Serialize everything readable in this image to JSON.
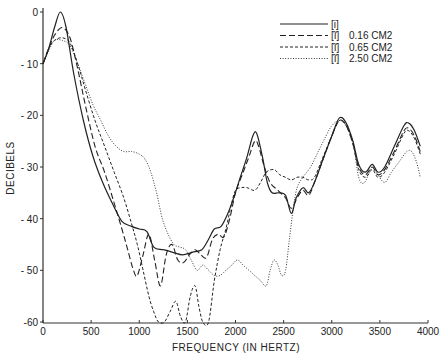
{
  "chart_data": {
    "type": "line",
    "title": "",
    "xlabel": "FREQUENCY (IN HERTZ)",
    "ylabel": "DECIBELS",
    "xlim": [
      0,
      4000
    ],
    "ylim": [
      -60,
      0
    ],
    "x_ticks": [
      0,
      500,
      1000,
      1500,
      2000,
      2500,
      3000,
      3500,
      4000
    ],
    "x_tick_labels": [
      "0",
      "500",
      "1000",
      "1500",
      "2000",
      "2500",
      "3000",
      "3500",
      "4000"
    ],
    "y_ticks": [
      0,
      -10,
      -20,
      -30,
      -40,
      -50,
      -60
    ],
    "y_tick_labels": [
      "0",
      "- 10",
      "- 20",
      "- 30",
      "- 40",
      "- 50",
      "-60"
    ],
    "grid": false,
    "legend_position": "upper right",
    "series": [
      {
        "name": "[i]",
        "label": "",
        "style": "solid",
        "points": [
          [
            0,
            -10
          ],
          [
            60,
            -7
          ],
          [
            120,
            -3
          ],
          [
            180,
            0
          ],
          [
            240,
            -3
          ],
          [
            320,
            -12
          ],
          [
            420,
            -21
          ],
          [
            520,
            -28
          ],
          [
            620,
            -33
          ],
          [
            720,
            -37
          ],
          [
            820,
            -40.5
          ],
          [
            920,
            -41.5
          ],
          [
            1000,
            -42
          ],
          [
            1080,
            -42.5
          ],
          [
            1150,
            -45.5
          ],
          [
            1250,
            -46
          ],
          [
            1350,
            -46.5
          ],
          [
            1450,
            -47
          ],
          [
            1550,
            -46.5
          ],
          [
            1650,
            -46
          ],
          [
            1720,
            -44
          ],
          [
            1780,
            -42
          ],
          [
            1850,
            -41.5
          ],
          [
            1920,
            -39
          ],
          [
            1980,
            -36
          ],
          [
            2050,
            -32
          ],
          [
            2120,
            -28
          ],
          [
            2180,
            -24
          ],
          [
            2220,
            -23.5
          ],
          [
            2280,
            -28
          ],
          [
            2330,
            -33
          ],
          [
            2380,
            -35
          ],
          [
            2450,
            -35
          ],
          [
            2520,
            -35.5
          ],
          [
            2580,
            -39
          ],
          [
            2630,
            -36
          ],
          [
            2700,
            -34
          ],
          [
            2760,
            -35
          ],
          [
            2820,
            -33
          ],
          [
            2900,
            -29
          ],
          [
            3000,
            -24
          ],
          [
            3080,
            -20.5
          ],
          [
            3150,
            -21.5
          ],
          [
            3220,
            -25
          ],
          [
            3280,
            -29.5
          ],
          [
            3350,
            -31
          ],
          [
            3420,
            -29.5
          ],
          [
            3480,
            -31
          ],
          [
            3550,
            -30
          ],
          [
            3650,
            -26
          ],
          [
            3750,
            -22
          ],
          [
            3800,
            -21.5
          ],
          [
            3860,
            -23
          ],
          [
            3920,
            -26
          ]
        ]
      },
      {
        "name": "[ĩ]",
        "label": "0.16 CM2",
        "style": "dashed-long",
        "points": [
          [
            0,
            -10
          ],
          [
            60,
            -7
          ],
          [
            120,
            -4.5
          ],
          [
            200,
            -3
          ],
          [
            280,
            -5
          ],
          [
            360,
            -11
          ],
          [
            440,
            -18
          ],
          [
            540,
            -26
          ],
          [
            640,
            -31
          ],
          [
            740,
            -37
          ],
          [
            820,
            -42
          ],
          [
            880,
            -46
          ],
          [
            940,
            -50
          ],
          [
            980,
            -51
          ],
          [
            1040,
            -47
          ],
          [
            1100,
            -43
          ],
          [
            1160,
            -48
          ],
          [
            1220,
            -53
          ],
          [
            1280,
            -47
          ],
          [
            1340,
            -45
          ],
          [
            1400,
            -48
          ],
          [
            1460,
            -48.5
          ],
          [
            1520,
            -47
          ],
          [
            1580,
            -46
          ],
          [
            1640,
            -47
          ],
          [
            1700,
            -47.5
          ],
          [
            1760,
            -44
          ],
          [
            1820,
            -43
          ],
          [
            1880,
            -43.5
          ],
          [
            1940,
            -40
          ],
          [
            2000,
            -35
          ],
          [
            2080,
            -31
          ],
          [
            2140,
            -28
          ],
          [
            2200,
            -25
          ],
          [
            2240,
            -26
          ],
          [
            2300,
            -30
          ],
          [
            2360,
            -33
          ],
          [
            2440,
            -34.5
          ],
          [
            2520,
            -36
          ],
          [
            2580,
            -38
          ],
          [
            2640,
            -36
          ],
          [
            2700,
            -34.5
          ],
          [
            2760,
            -35.5
          ],
          [
            2820,
            -33
          ],
          [
            2900,
            -29
          ],
          [
            3000,
            -24
          ],
          [
            3080,
            -21
          ],
          [
            3150,
            -22
          ],
          [
            3220,
            -25.5
          ],
          [
            3280,
            -30
          ],
          [
            3350,
            -31.5
          ],
          [
            3420,
            -30
          ],
          [
            3480,
            -31.5
          ],
          [
            3550,
            -30.5
          ],
          [
            3650,
            -27
          ],
          [
            3750,
            -23
          ],
          [
            3800,
            -22.5
          ],
          [
            3860,
            -24
          ],
          [
            3920,
            -27
          ]
        ]
      },
      {
        "name": "[ĩ]",
        "label": "0.65 CM2",
        "style": "dashed-short",
        "points": [
          [
            0,
            -10
          ],
          [
            60,
            -7
          ],
          [
            120,
            -5.5
          ],
          [
            200,
            -5
          ],
          [
            280,
            -6
          ],
          [
            360,
            -10
          ],
          [
            440,
            -15
          ],
          [
            540,
            -21
          ],
          [
            640,
            -26
          ],
          [
            740,
            -31
          ],
          [
            840,
            -36
          ],
          [
            920,
            -41
          ],
          [
            980,
            -45
          ],
          [
            1040,
            -50
          ],
          [
            1100,
            -55
          ],
          [
            1150,
            -58
          ],
          [
            1200,
            -60
          ],
          [
            1260,
            -60
          ],
          [
            1320,
            -58
          ],
          [
            1380,
            -56
          ],
          [
            1430,
            -59
          ],
          [
            1480,
            -60
          ],
          [
            1530,
            -55
          ],
          [
            1580,
            -53
          ],
          [
            1620,
            -57
          ],
          [
            1660,
            -60
          ],
          [
            1720,
            -60
          ],
          [
            1780,
            -52
          ],
          [
            1840,
            -46
          ],
          [
            1900,
            -42
          ],
          [
            1960,
            -37
          ],
          [
            2000,
            -34.5
          ],
          [
            2060,
            -34
          ],
          [
            2120,
            -34
          ],
          [
            2200,
            -34.5
          ],
          [
            2260,
            -33
          ],
          [
            2320,
            -31
          ],
          [
            2400,
            -30.5
          ],
          [
            2460,
            -31.5
          ],
          [
            2520,
            -32
          ],
          [
            2580,
            -32.5
          ],
          [
            2640,
            -32
          ],
          [
            2700,
            -32
          ],
          [
            2760,
            -32.5
          ],
          [
            2820,
            -32
          ],
          [
            2900,
            -28.5
          ],
          [
            3000,
            -24
          ],
          [
            3080,
            -21
          ],
          [
            3150,
            -22
          ],
          [
            3220,
            -25.5
          ],
          [
            3280,
            -30.5
          ],
          [
            3350,
            -32
          ],
          [
            3420,
            -30.5
          ],
          [
            3480,
            -32
          ],
          [
            3550,
            -31
          ],
          [
            3650,
            -27.5
          ],
          [
            3750,
            -23.5
          ],
          [
            3800,
            -23
          ],
          [
            3860,
            -24.5
          ],
          [
            3920,
            -27.5
          ]
        ]
      },
      {
        "name": "[ĩ]",
        "label": "2.50 CM2",
        "style": "dotted",
        "points": [
          [
            0,
            -10
          ],
          [
            60,
            -7.5
          ],
          [
            120,
            -5.5
          ],
          [
            200,
            -5.5
          ],
          [
            280,
            -6.5
          ],
          [
            360,
            -10
          ],
          [
            440,
            -14
          ],
          [
            520,
            -18
          ],
          [
            600,
            -21
          ],
          [
            680,
            -24
          ],
          [
            760,
            -26
          ],
          [
            840,
            -27
          ],
          [
            920,
            -27
          ],
          [
            1000,
            -27.5
          ],
          [
            1060,
            -28.5
          ],
          [
            1120,
            -31
          ],
          [
            1180,
            -35
          ],
          [
            1240,
            -40
          ],
          [
            1300,
            -43
          ],
          [
            1360,
            -45
          ],
          [
            1420,
            -45.5
          ],
          [
            1480,
            -46
          ],
          [
            1540,
            -48
          ],
          [
            1600,
            -50
          ],
          [
            1660,
            -49
          ],
          [
            1720,
            -50
          ],
          [
            1780,
            -51
          ],
          [
            1840,
            -51
          ],
          [
            1900,
            -50
          ],
          [
            1960,
            -49
          ],
          [
            2020,
            -48
          ],
          [
            2080,
            -49
          ],
          [
            2140,
            -50
          ],
          [
            2200,
            -51
          ],
          [
            2260,
            -52
          ],
          [
            2320,
            -53
          ],
          [
            2360,
            -50
          ],
          [
            2400,
            -48
          ],
          [
            2440,
            -49
          ],
          [
            2480,
            -51
          ],
          [
            2520,
            -50
          ],
          [
            2560,
            -44
          ],
          [
            2600,
            -38
          ],
          [
            2640,
            -34
          ],
          [
            2700,
            -32
          ],
          [
            2780,
            -30
          ],
          [
            2860,
            -27
          ],
          [
            2940,
            -24
          ],
          [
            3000,
            -22
          ],
          [
            3080,
            -21
          ],
          [
            3150,
            -22
          ],
          [
            3220,
            -25
          ],
          [
            3280,
            -32
          ],
          [
            3340,
            -33
          ],
          [
            3420,
            -30
          ],
          [
            3480,
            -31.5
          ],
          [
            3550,
            -33
          ],
          [
            3620,
            -31
          ],
          [
            3700,
            -29
          ],
          [
            3780,
            -27
          ],
          [
            3830,
            -27
          ],
          [
            3880,
            -29
          ],
          [
            3920,
            -32
          ]
        ]
      }
    ]
  }
}
